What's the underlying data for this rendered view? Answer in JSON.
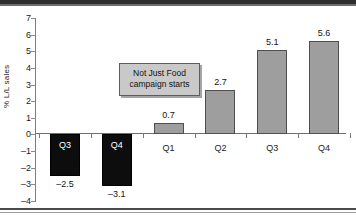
{
  "chart_data": {
    "type": "bar",
    "title": "",
    "subtitle": "",
    "xlabel": "",
    "ylabel": "% L/L sales",
    "categories": [
      "Q3",
      "Q4",
      "Q1",
      "Q2",
      "Q3",
      "Q4"
    ],
    "values": [
      -2.5,
      -3.1,
      0.7,
      2.7,
      5.1,
      5.6
    ],
    "value_labels": [
      "–2.5",
      "–3.1",
      "0.7",
      "2.7",
      "5.1",
      "5.6"
    ],
    "series": [
      {
        "name": "% L/L sales",
        "values": [
          -2.5,
          -3.1,
          0.7,
          2.7,
          5.1,
          5.6
        ],
        "colors": [
          "#0d0d0d",
          "#0d0d0d",
          "#9e9e9e",
          "#9e9e9e",
          "#9e9e9e",
          "#9e9e9e"
        ]
      }
    ],
    "ylim": [
      -4,
      7
    ],
    "ytick_labels": [
      "7",
      "6",
      "5",
      "4",
      "3",
      "2",
      "1",
      "0",
      "–1",
      "–2",
      "–3",
      "–4"
    ],
    "ytick_values": [
      7,
      6,
      5,
      4,
      3,
      2,
      1,
      0,
      -1,
      -2,
      -3,
      -4
    ],
    "grid": false,
    "legend": false,
    "legend_position": "none",
    "annotations": [
      {
        "name": "campaign-callout",
        "lines": [
          "Not Just Food",
          "campaign starts"
        ],
        "fill": "#c9c9c9",
        "border": "#5d5d5d"
      }
    ],
    "colors": {
      "negative_bar": "#0d0d0d",
      "positive_bar": "#9e9e9e",
      "bar_border": "#4f4f4f",
      "axis": "#7d7d7d",
      "text": "#141414",
      "inside_label": "#ffffff"
    }
  }
}
